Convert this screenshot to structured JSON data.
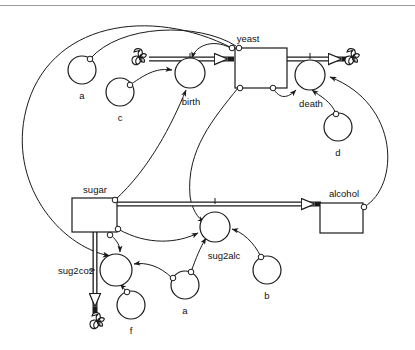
{
  "diagram": {
    "type": "system-dynamics-stock-and-flow",
    "title_bar_present": true,
    "stocks": [
      {
        "id": "yeast",
        "label": "yeast",
        "x": 235,
        "y": 48,
        "w": 52,
        "h": 40
      },
      {
        "id": "sugar",
        "label": "sugar",
        "x": 72,
        "y": 198,
        "w": 45,
        "h": 34
      },
      {
        "id": "alcohol",
        "label": "alcohol",
        "x": 320,
        "y": 203,
        "w": 43,
        "h": 30
      }
    ],
    "flows": [
      {
        "id": "birth",
        "label": "birth",
        "cx": 190,
        "cy": 73,
        "r": 15
      },
      {
        "id": "death",
        "label": "death",
        "cx": 310,
        "cy": 75,
        "r": 15
      },
      {
        "id": "sug2alc",
        "label": "sug2alc",
        "cx": 215,
        "cy": 227,
        "r": 15
      },
      {
        "id": "sug2co2",
        "label": "sug2co2",
        "cx": 116,
        "cy": 270,
        "r": 16
      }
    ],
    "converters": [
      {
        "id": "a_top",
        "label": "a",
        "cx": 82,
        "cy": 70,
        "r": 14
      },
      {
        "id": "c",
        "label": "c",
        "cx": 120,
        "cy": 92,
        "r": 14
      },
      {
        "id": "d",
        "label": "d",
        "cx": 338,
        "cy": 127,
        "r": 14
      },
      {
        "id": "b",
        "label": "b",
        "cx": 267,
        "cy": 270,
        "r": 14
      },
      {
        "id": "a_bottom",
        "label": "a",
        "cx": 185,
        "cy": 285,
        "r": 14
      },
      {
        "id": "f",
        "label": "f",
        "cx": 131,
        "cy": 305,
        "r": 14
      }
    ],
    "clouds": [
      {
        "id": "cloud-birth-source",
        "cx": 140,
        "cy": 58,
        "r": 9
      },
      {
        "id": "cloud-death-sink",
        "cx": 353,
        "cy": 58,
        "r": 9
      },
      {
        "id": "cloud-co2-sink",
        "cx": 98,
        "cy": 322,
        "r": 9
      }
    ],
    "labels": {
      "yeast": "yeast",
      "sugar": "sugar",
      "alcohol": "alcohol",
      "birth": "birth",
      "death": "death",
      "sug2alc": "sug2alc",
      "sug2co2": "sug2co2",
      "a_top": "a",
      "c": "c",
      "d": "d",
      "b": "b",
      "a_bottom": "a",
      "f": "f"
    },
    "colors": {
      "stroke": "#1a1a1a",
      "fill": "#ffffff",
      "text": "#111111",
      "titlebar": "#9a9a9a"
    }
  }
}
